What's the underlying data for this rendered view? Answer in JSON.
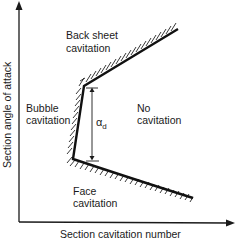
{
  "diagram": {
    "type": "cavitation bucket diagram",
    "axes": {
      "x_label": "Section cavitation number",
      "y_label": "Section angle of attack"
    },
    "regions": [
      {
        "id": "back-sheet",
        "line1": "Back sheet",
        "line2": "cavitation"
      },
      {
        "id": "bubble",
        "line1": "Bubble",
        "line2": "cavitation"
      },
      {
        "id": "no",
        "line1": "No",
        "line2": "cavitation"
      },
      {
        "id": "face",
        "line1": "Face",
        "line2": "cavitation"
      }
    ],
    "dimension": {
      "symbol": "α",
      "subscript": "d"
    },
    "colors": {
      "ink": "#1a1a1a",
      "background": "#ffffff"
    }
  }
}
